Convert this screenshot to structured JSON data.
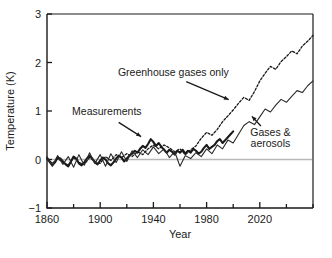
{
  "chart_data": {
    "type": "line",
    "title": "",
    "xlabel": "Year",
    "ylabel": "Temperature (K)",
    "xlim": [
      1860,
      2060
    ],
    "ylim": [
      -1,
      3
    ],
    "xticks": [
      1860,
      1880,
      1900,
      1920,
      1940,
      1960,
      1980,
      2000,
      2020,
      2040,
      2060
    ],
    "xtick_labels": [
      "1860",
      "",
      "1900",
      "",
      "1940",
      "",
      "1980",
      "",
      "2020",
      "",
      ""
    ],
    "xtick_labels_major": [
      "1860",
      "1900",
      "1940",
      "1980",
      "2020"
    ],
    "yticks": [
      -1,
      0,
      1,
      2,
      3
    ],
    "ytick_labels": [
      "-1",
      "0",
      "1",
      "2",
      "3"
    ],
    "grid": false,
    "zero_reference_line": 0,
    "legend": "annotations",
    "annotations": [
      {
        "text": "Greenhouse gases only",
        "x": 1955,
        "y": 1.72,
        "arrow_to_x": 1998,
        "arrow_to_y": 1.22
      },
      {
        "text": "Measurements",
        "x": 1905,
        "y": 0.92,
        "arrow_to_x": 1932,
        "arrow_to_y": 0.45
      },
      {
        "text": "Gases &",
        "x": 2028,
        "y": 0.48,
        "arrow_to_x": 2013,
        "arrow_to_y": 0.92
      },
      {
        "text": "aerosols",
        "x": 2028,
        "y": 0.26
      }
    ],
    "series": [
      {
        "name": "Measurements",
        "style": "solid-thick",
        "color": "#1a1a1a",
        "x": [
          1860,
          1862,
          1864,
          1866,
          1868,
          1870,
          1872,
          1874,
          1876,
          1878,
          1880,
          1882,
          1884,
          1886,
          1888,
          1890,
          1892,
          1894,
          1896,
          1898,
          1900,
          1902,
          1904,
          1906,
          1908,
          1910,
          1912,
          1914,
          1916,
          1918,
          1920,
          1922,
          1924,
          1926,
          1928,
          1930,
          1932,
          1934,
          1936,
          1938,
          1940,
          1942,
          1944,
          1946,
          1948,
          1950,
          1952,
          1954,
          1956,
          1958,
          1960,
          1962,
          1964,
          1966,
          1968,
          1970,
          1972,
          1974,
          1976,
          1978,
          1980,
          1982,
          1984,
          1986,
          1988,
          1990,
          1992,
          1994,
          1996,
          1998,
          2000
        ],
        "values": [
          0.03,
          -0.05,
          -0.12,
          -0.06,
          0.04,
          0.02,
          -0.04,
          -0.1,
          -0.14,
          -0.04,
          0.06,
          0.02,
          -0.08,
          -0.12,
          -0.06,
          0.02,
          0.08,
          0.02,
          -0.06,
          -0.1,
          -0.02,
          0.04,
          0.0,
          -0.08,
          -0.12,
          -0.06,
          0.02,
          0.08,
          0.04,
          -0.04,
          0.02,
          0.08,
          0.12,
          0.18,
          0.14,
          0.22,
          0.28,
          0.24,
          0.32,
          0.42,
          0.36,
          0.28,
          0.34,
          0.26,
          0.2,
          0.14,
          0.2,
          0.16,
          0.1,
          0.18,
          0.14,
          0.2,
          0.12,
          0.18,
          0.14,
          0.22,
          0.18,
          0.12,
          0.16,
          0.24,
          0.3,
          0.22,
          0.26,
          0.3,
          0.38,
          0.42,
          0.34,
          0.4,
          0.46,
          0.52,
          0.58
        ]
      },
      {
        "name": "Greenhouse gases only",
        "style": "dotted",
        "color": "#1a1a1a",
        "x": [
          1860,
          1864,
          1868,
          1872,
          1876,
          1880,
          1884,
          1888,
          1892,
          1896,
          1900,
          1904,
          1908,
          1912,
          1916,
          1920,
          1924,
          1928,
          1932,
          1936,
          1940,
          1944,
          1948,
          1952,
          1956,
          1960,
          1964,
          1968,
          1972,
          1976,
          1980,
          1984,
          1988,
          1992,
          1996,
          2000,
          2004,
          2008,
          2012,
          2016,
          2020,
          2024,
          2028,
          2032,
          2036,
          2040,
          2044,
          2048,
          2052,
          2056,
          2060
        ],
        "values": [
          0.02,
          -0.08,
          0.02,
          -0.06,
          -0.12,
          0.04,
          -0.06,
          -0.1,
          0.04,
          -0.04,
          -0.08,
          0.06,
          -0.02,
          0.1,
          0.04,
          0.12,
          0.06,
          0.16,
          0.1,
          0.22,
          0.3,
          0.22,
          0.3,
          0.24,
          0.16,
          0.22,
          0.1,
          0.2,
          0.28,
          0.44,
          0.56,
          0.5,
          0.62,
          0.78,
          0.9,
          1.02,
          1.16,
          1.28,
          1.22,
          1.4,
          1.62,
          1.78,
          1.92,
          1.86,
          2.02,
          2.12,
          2.24,
          2.18,
          2.34,
          2.44,
          2.56
        ]
      },
      {
        "name": "Gases & aerosols",
        "style": "solid-thin",
        "color": "#2a2a2a",
        "x": [
          1860,
          1864,
          1868,
          1872,
          1876,
          1880,
          1884,
          1888,
          1892,
          1896,
          1900,
          1904,
          1908,
          1912,
          1916,
          1920,
          1924,
          1928,
          1932,
          1936,
          1940,
          1944,
          1948,
          1952,
          1956,
          1960,
          1964,
          1968,
          1972,
          1976,
          1980,
          1984,
          1988,
          1992,
          1996,
          2000,
          2004,
          2008,
          2012,
          2016,
          2020,
          2024,
          2028,
          2032,
          2036,
          2040,
          2044,
          2048,
          2052,
          2056,
          2060
        ],
        "values": [
          0.06,
          -0.14,
          0.08,
          -0.1,
          0.06,
          -0.16,
          0.1,
          -0.12,
          0.14,
          -0.08,
          0.1,
          -0.14,
          0.12,
          -0.06,
          0.16,
          -0.04,
          0.18,
          0.04,
          0.2,
          0.1,
          0.26,
          0.12,
          0.22,
          0.04,
          0.16,
          -0.14,
          0.08,
          0.02,
          0.14,
          0.06,
          0.22,
          0.12,
          0.3,
          0.22,
          0.4,
          0.34,
          0.52,
          0.7,
          0.78,
          0.72,
          0.88,
          1.04,
          0.98,
          1.12,
          1.24,
          1.18,
          1.3,
          1.42,
          1.38,
          1.52,
          1.62
        ]
      }
    ]
  }
}
